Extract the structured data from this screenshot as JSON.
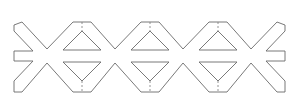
{
  "figure": {
    "width": 306,
    "height": 109,
    "background": "#ffffff",
    "stroke_color": "#6a6a6a",
    "peaks_x": [
      82,
      150,
      218
    ],
    "valleys_x": [
      47,
      115,
      183,
      251
    ],
    "outer_top_y": 22,
    "outer_bottom_y": 92,
    "mid_bar_top_y": 51,
    "mid_bar_bottom_y": 61,
    "left_edge_x": 14,
    "right_edge_x": 285,
    "triangle_cutouts_count": 6,
    "fold_lines_count": 3
  }
}
